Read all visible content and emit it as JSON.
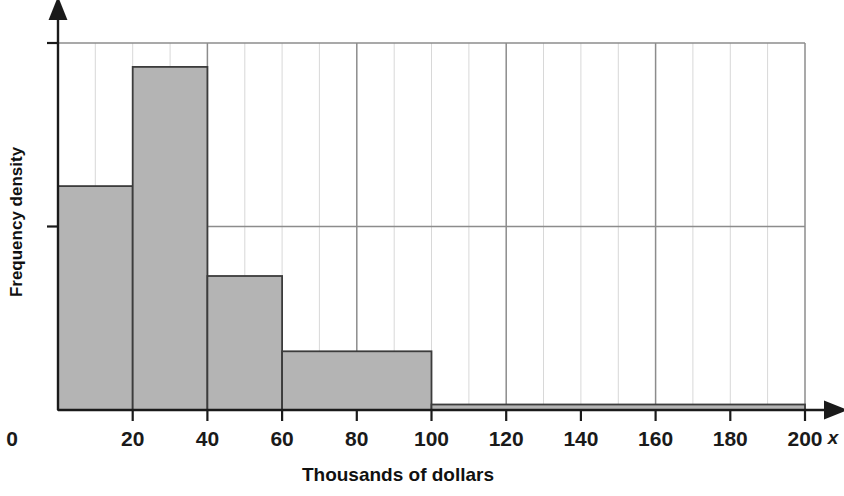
{
  "chart_data": {
    "type": "bar",
    "subtype": "histogram",
    "title": "",
    "xlabel": "Thousands of dollars",
    "ylabel": "Frequency density",
    "x_axis_variable_label": "x",
    "xlim": [
      0,
      200
    ],
    "ylim": [
      0,
      2.03
    ],
    "xticks": [
      0,
      20,
      40,
      60,
      80,
      100,
      120,
      140,
      160,
      180,
      200
    ],
    "xtick_labels": [
      "0",
      "20",
      "40",
      "60",
      "80",
      "100",
      "120",
      "140",
      "160",
      "180",
      "200"
    ],
    "yticks": [
      0,
      1,
      2
    ],
    "ytick_labels": [
      "0",
      "",
      ""
    ],
    "grid": {
      "vertical": true,
      "vertical_step": 10,
      "vertical_major_step": 40,
      "horizontal": true,
      "horizontal_values": [
        1,
        2
      ]
    },
    "legend": null,
    "bins": [
      {
        "start": 0,
        "end": 20,
        "frequency_density": 1.22
      },
      {
        "start": 20,
        "end": 40,
        "frequency_density": 1.87
      },
      {
        "start": 40,
        "end": 60,
        "frequency_density": 0.73
      },
      {
        "start": 60,
        "end": 100,
        "frequency_density": 0.32
      },
      {
        "start": 100,
        "end": 200,
        "frequency_density": 0.03
      }
    ],
    "bar_fill_color": "#b4b4b4",
    "bar_edge_color": "#3c3c3c",
    "axis_color": "#1a1a1a",
    "gridline_color": "#d8d8d8",
    "gridline_major_color": "#8c8c8c"
  },
  "axes": {
    "x_title": "Thousands of dollars",
    "y_title": "Frequency density",
    "x_variable": "x",
    "origin_label": "0"
  }
}
